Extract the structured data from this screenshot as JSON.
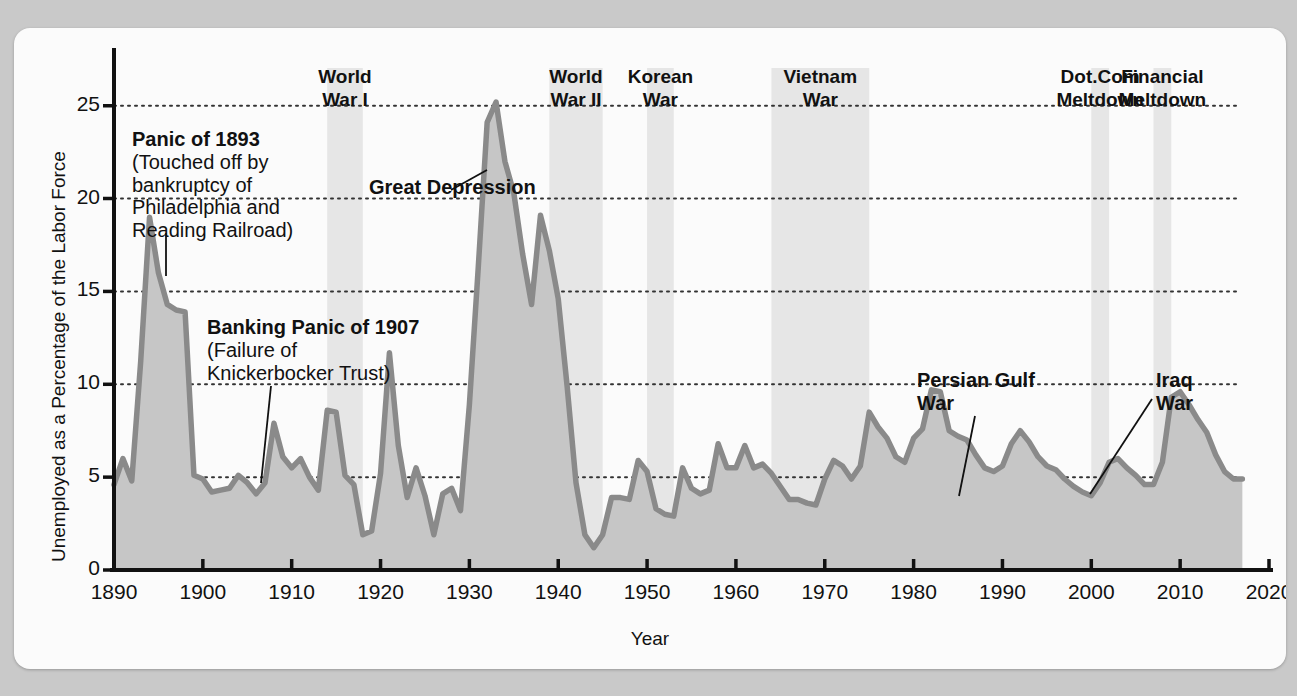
{
  "chart_data": {
    "type": "area",
    "title": "",
    "xlabel": "Year",
    "ylabel": "Unemployed as a Percentage of the Labor Force",
    "xlim": [
      1890,
      2020
    ],
    "ylim": [
      0,
      28
    ],
    "xticks": [
      1890,
      1900,
      1910,
      1920,
      1930,
      1940,
      1950,
      1960,
      1970,
      1980,
      1990,
      2000,
      2010,
      2020
    ],
    "yticks": [
      0,
      5,
      10,
      15,
      20,
      25
    ],
    "grid": "horizontal-dotted",
    "legend": "none",
    "series": [
      {
        "name": "Unemployment rate",
        "x": [
          1890,
          1891,
          1892,
          1893,
          1894,
          1895,
          1896,
          1897,
          1898,
          1899,
          1900,
          1901,
          1902,
          1903,
          1904,
          1905,
          1906,
          1907,
          1908,
          1909,
          1910,
          1911,
          1912,
          1913,
          1914,
          1915,
          1916,
          1917,
          1918,
          1919,
          1920,
          1921,
          1922,
          1923,
          1924,
          1925,
          1926,
          1927,
          1928,
          1929,
          1930,
          1931,
          1932,
          1933,
          1934,
          1935,
          1936,
          1937,
          1938,
          1939,
          1940,
          1941,
          1942,
          1943,
          1944,
          1945,
          1946,
          1947,
          1948,
          1949,
          1950,
          1951,
          1952,
          1953,
          1954,
          1955,
          1956,
          1957,
          1958,
          1959,
          1960,
          1961,
          1962,
          1963,
          1964,
          1965,
          1966,
          1967,
          1968,
          1969,
          1970,
          1971,
          1972,
          1973,
          1974,
          1975,
          1976,
          1977,
          1978,
          1979,
          1980,
          1981,
          1982,
          1983,
          1984,
          1985,
          1986,
          1987,
          1988,
          1989,
          1990,
          1991,
          1992,
          1993,
          1994,
          1995,
          1996,
          1997,
          1998,
          1999,
          2000,
          2001,
          2002,
          2003,
          2004,
          2005,
          2006,
          2007,
          2008,
          2009,
          2010,
          2011,
          2012,
          2013,
          2014,
          2015,
          2016,
          2017
        ],
        "y": [
          4.6,
          6.0,
          4.8,
          11.2,
          19.0,
          16.0,
          14.3,
          14.0,
          13.9,
          5.1,
          4.9,
          4.2,
          4.3,
          4.4,
          5.1,
          4.7,
          4.1,
          4.7,
          7.9,
          6.1,
          5.5,
          6.0,
          5.0,
          4.3,
          8.6,
          8.5,
          5.1,
          4.6,
          1.9,
          2.1,
          5.2,
          11.7,
          6.7,
          3.9,
          5.5,
          4.0,
          1.9,
          4.1,
          4.4,
          3.2,
          8.9,
          16.3,
          24.1,
          25.2,
          22.0,
          20.3,
          17.0,
          14.3,
          19.1,
          17.2,
          14.6,
          9.9,
          4.7,
          1.9,
          1.2,
          1.9,
          3.9,
          3.9,
          3.8,
          5.9,
          5.3,
          3.3,
          3.0,
          2.9,
          5.5,
          4.4,
          4.1,
          4.3,
          6.8,
          5.5,
          5.5,
          6.7,
          5.5,
          5.7,
          5.2,
          4.5,
          3.8,
          3.8,
          3.6,
          3.5,
          4.9,
          5.9,
          5.6,
          4.9,
          5.6,
          8.5,
          7.7,
          7.1,
          6.1,
          5.8,
          7.1,
          7.6,
          9.7,
          9.6,
          7.5,
          7.2,
          7.0,
          6.2,
          5.5,
          5.3,
          5.6,
          6.8,
          7.5,
          6.9,
          6.1,
          5.6,
          5.4,
          4.9,
          4.5,
          4.2,
          4.0,
          4.7,
          5.8,
          6.0,
          5.5,
          5.1,
          4.6,
          4.6,
          5.8,
          9.3,
          9.6,
          8.9,
          8.1,
          7.4,
          6.2,
          5.3,
          4.9,
          4.9
        ],
        "peak_values": {
          "panic_1893_peak": 19.0,
          "panic_1907_peak": 7.9,
          "postwar_1921_peak": 11.7,
          "great_depression_peak": 25.2,
          "wwii_low": 1.2,
          "recession_1982_peak": 9.7,
          "financial_crisis_peak": 9.6
        }
      }
    ],
    "shaded_periods": [
      {
        "label": "World\nWar I",
        "start": 1914,
        "end": 1918
      },
      {
        "label": "World\nWar II",
        "start": 1939,
        "end": 1945
      },
      {
        "label": "Korean\nWar",
        "start": 1950,
        "end": 1953
      },
      {
        "label": "Vietnam\nWar",
        "start": 1964,
        "end": 1975
      },
      {
        "label": "Dot.Com\nMeltdown",
        "start": 2000,
        "end": 2002
      },
      {
        "label": "Financial\nMeltdown",
        "start": 2007,
        "end": 2009
      }
    ],
    "annotations": [
      {
        "title": "Panic of 1893",
        "body": "(Touched off by\nbankruptcy of\nPhiladelphia and\nReading Railroad)",
        "points_to_year": 1894
      },
      {
        "title": "Banking Panic of 1907",
        "body": "(Failure of\nKnickerbocker Trust)",
        "points_to_year": 1908
      },
      {
        "title": "Great Depression",
        "body": "",
        "points_to_year": 1933
      },
      {
        "title": "Persian Gulf\nWar",
        "body": "",
        "points_to_year": 1991
      },
      {
        "title": "Iraq\nWar",
        "body": "",
        "points_to_year": 2003
      }
    ],
    "colors": {
      "area_fill": "#c6c6c6",
      "line": "#8a8a8a",
      "band_fill": "#e6e6e6",
      "axis": "#111111",
      "grid": "#333333",
      "figure_background": "#fbfbfb",
      "page_background": "#c9c9c9"
    }
  }
}
